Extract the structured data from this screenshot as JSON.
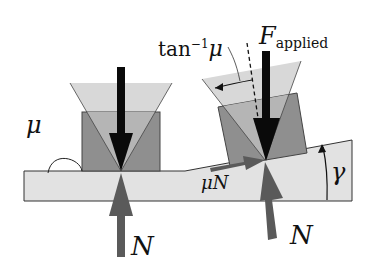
{
  "diagram": {
    "labels": {
      "mu": "μ",
      "tan_inv": "tan",
      "tan_sup": "−1",
      "tan_mu": "μ",
      "f": "F",
      "f_sub": "applied",
      "mu_n": "μN",
      "n_left": "N",
      "n_right": "N",
      "gamma": "γ"
    },
    "colors": {
      "background": "#ffffff",
      "slab": "#e2e2e2",
      "block": "#8f8f8f",
      "cone": "#cfcfcf",
      "force_arrow": "#0a0a0a",
      "reaction_arrow": "#5a5a5a",
      "outline": "#333333"
    }
  }
}
